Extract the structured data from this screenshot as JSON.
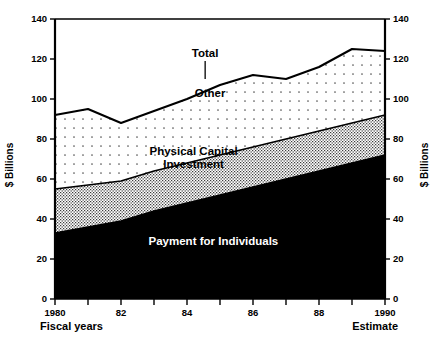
{
  "chart_data": {
    "type": "area",
    "stacked": true,
    "title": "",
    "subtitle": "",
    "xlabel": "Fiscal years",
    "xlabel_right": "Estimate",
    "ylabel": "$ Billions",
    "ylabel_right": "$ Billions",
    "ylim": [
      0,
      140
    ],
    "xlim": [
      1980,
      1990
    ],
    "y_ticks": [
      0,
      20,
      40,
      60,
      80,
      100,
      120,
      140
    ],
    "y_tick_labels": [
      "0",
      "20",
      "40",
      "60",
      "80",
      "100",
      "120",
      "140"
    ],
    "x": [
      1980,
      1981,
      1982,
      1983,
      1984,
      1985,
      1986,
      1987,
      1988,
      1989,
      1990
    ],
    "x_tick_labels": [
      "1980",
      "",
      "82",
      "",
      "84",
      "",
      "86",
      "",
      "88",
      "",
      "1990"
    ],
    "grid": false,
    "legend": "inline-annotations",
    "series": [
      {
        "name": "Payment for Individuals",
        "fill": "#000000",
        "label_color": "#ffffff",
        "values": [
          33,
          36,
          39,
          44,
          48,
          52,
          56,
          60,
          64,
          68,
          72
        ]
      },
      {
        "name": "Physical Capital Investment",
        "fill": "#b8b8b8",
        "label_color": "#000000",
        "values": [
          22,
          21,
          20,
          20,
          20,
          20,
          20,
          20,
          20,
          20,
          20
        ]
      },
      {
        "name": "Other",
        "fill": "#f4f4f4",
        "label_color": "#000000",
        "values": [
          37,
          38,
          29,
          30,
          32,
          35,
          36,
          30,
          32,
          37,
          32
        ]
      }
    ],
    "cumulative_totals": {
      "payments_top": [
        33,
        36,
        39,
        44,
        48,
        52,
        56,
        60,
        64,
        68,
        72
      ],
      "physical_top": [
        55,
        57,
        59,
        64,
        68,
        72,
        76,
        80,
        84,
        88,
        92
      ],
      "total": [
        92,
        95,
        88,
        94,
        100,
        107,
        112,
        110,
        116,
        125,
        124
      ]
    },
    "annotations": [
      {
        "name": "Total",
        "text": "Total",
        "x": 1984.55,
        "y": 121,
        "leader": true
      },
      {
        "name": "Other",
        "text": "Other",
        "x": 1984.7,
        "y": 101,
        "leader": false
      },
      {
        "name": "Physical Capital Investment",
        "text_line_1": "Physical Capital",
        "text_line_2": "Investment",
        "x": 1984.2,
        "y": 72,
        "leader": false
      },
      {
        "name": "Payment for Individuals",
        "text": "Payment for Individuals",
        "x": 1984.8,
        "y": 27,
        "leader": false
      }
    ]
  }
}
